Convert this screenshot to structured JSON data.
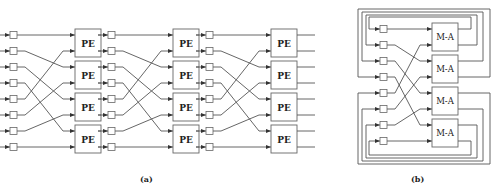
{
  "figure": {
    "panel_a": {
      "caption": "(a)",
      "node_label": "PE",
      "stages": 3,
      "rows": 8,
      "row_y": [
        35,
        51,
        67,
        83,
        99,
        115,
        131,
        147
      ],
      "interconnect": "perfect-shuffle",
      "shuffle_map": [
        0,
        2,
        4,
        6,
        1,
        3,
        5,
        7
      ],
      "stage_latch_x": [
        10,
        108,
        206
      ],
      "stage_box_x": [
        75,
        173,
        271
      ],
      "box_width": 26,
      "output_end_x": 315
    },
    "panel_b": {
      "caption": "(b)",
      "node_label": "M-A",
      "rows": 8,
      "row_y": [
        29,
        45,
        61,
        77,
        93,
        109,
        125,
        141
      ],
      "interconnect": "perfect-shuffle-with-feedback",
      "latch_x": 380,
      "box_x": 432,
      "box_width": 26
    }
  },
  "colors": {
    "line": "#555555",
    "box_stroke": "#666666",
    "text": "#222222",
    "background": "#ffffff"
  }
}
